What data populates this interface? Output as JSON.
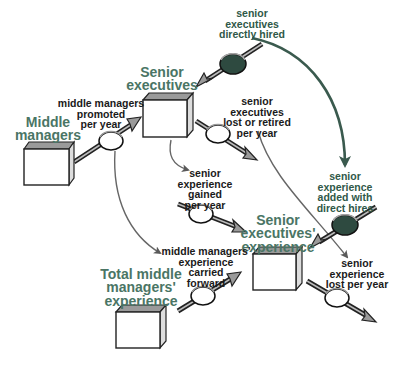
{
  "colors": {
    "stock_label": "#4a7565",
    "flow_label": "#1a1a1a",
    "green_flow_label": "#2f5848",
    "dark_valve": "#2e4a40",
    "green_connector": "#3a5a4e",
    "gray_connector": "#666666",
    "arrow_fill": "#9a9a9a",
    "box_top": "#9a9a9a"
  },
  "stocks": {
    "middle_managers": {
      "lines": [
        "Middle",
        "managers"
      ]
    },
    "senior_executives": {
      "lines": [
        "Senior",
        "executives"
      ]
    },
    "senior_executives_experience": {
      "lines": [
        "Senior",
        "executives'",
        "experience"
      ]
    },
    "total_middle_managers_experience": {
      "lines": [
        "Total middle",
        "managers'",
        "experience"
      ]
    }
  },
  "flows": {
    "senior_executives_directly_hired": {
      "lines": [
        "senior",
        "executives",
        "directly hired"
      ]
    },
    "middle_managers_promoted": {
      "lines": [
        "middle managers",
        "promoted",
        "per year"
      ]
    },
    "senior_executives_lost": {
      "lines": [
        "senior",
        "executives",
        "lost or retired",
        "per year"
      ]
    },
    "senior_experience_gained": {
      "lines": [
        "senior",
        "experience",
        "gained",
        "per year"
      ]
    },
    "senior_experience_added": {
      "lines": [
        "senior",
        "experience",
        "added with",
        "direct hires"
      ]
    },
    "middle_managers_experience_carried": {
      "lines": [
        "middle managers'",
        "experience",
        "carried",
        "forward"
      ]
    },
    "senior_experience_lost": {
      "lines": [
        "senior",
        "experience",
        "lost per year"
      ]
    }
  }
}
